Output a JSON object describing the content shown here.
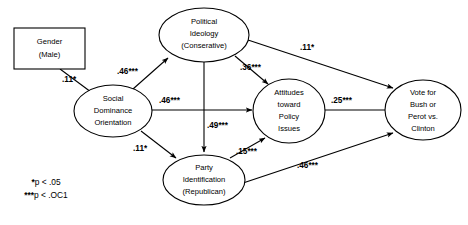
{
  "diagram": {
    "type": "path-diagram",
    "title": "",
    "nodes": [
      {
        "id": "gender",
        "shape": "rectangle",
        "lines": [
          "Gender",
          "(Male)"
        ]
      },
      {
        "id": "political-ideology",
        "shape": "ellipse",
        "lines": [
          "Political",
          "Ideology",
          "(Conserative)"
        ]
      },
      {
        "id": "social-dominance-orientation",
        "shape": "ellipse",
        "lines": [
          "Social",
          "Dominance",
          "Orientation"
        ]
      },
      {
        "id": "attitudes-toward-policy-issues",
        "shape": "ellipse",
        "lines": [
          "Attitudes",
          "toward",
          "Policy",
          "Issues"
        ]
      },
      {
        "id": "party-identification",
        "shape": "ellipse",
        "lines": [
          "Party",
          "Identification",
          "(Republican)"
        ]
      },
      {
        "id": "vote-outcome",
        "shape": "ellipse",
        "lines": [
          "Vote for",
          "Bush or",
          "Perot vs.",
          "Clinton"
        ]
      }
    ],
    "edges": [
      {
        "id": "gender-to-sdo",
        "from": "gender",
        "to": "social-dominance-orientation",
        "label": ".11*",
        "coefficient": 0.11,
        "significance": "*"
      },
      {
        "id": "sdo-to-ideology",
        "from": "social-dominance-orientation",
        "to": "political-ideology",
        "label": ".46***",
        "coefficient": 0.46,
        "significance": "***"
      },
      {
        "id": "sdo-to-attitudes",
        "from": "social-dominance-orientation",
        "to": "attitudes-toward-policy-issues",
        "label": ".46***",
        "coefficient": 0.46,
        "significance": "***"
      },
      {
        "id": "ideology-to-attitudes",
        "from": "political-ideology",
        "to": "attitudes-toward-policy-issues",
        "label": ".36***",
        "coefficient": 0.36,
        "significance": "***"
      },
      {
        "id": "ideology-to-vote",
        "from": "political-ideology",
        "to": "vote-outcome",
        "label": ".11*",
        "coefficient": 0.11,
        "significance": "*"
      },
      {
        "id": "ideology-to-party",
        "from": "political-ideology",
        "to": "party-identification",
        "label": ".49***",
        "coefficient": 0.49,
        "significance": "***"
      },
      {
        "id": "sdo-to-party",
        "from": "social-dominance-orientation",
        "to": "party-identification",
        "label": ".11*",
        "coefficient": 0.11,
        "significance": "*"
      },
      {
        "id": "attitudes-to-vote",
        "from": "attitudes-toward-policy-issues",
        "to": "vote-outcome",
        "label": ".25***",
        "coefficient": 0.25,
        "significance": "***"
      },
      {
        "id": "party-to-attitudes",
        "from": "party-identification",
        "to": "attitudes-toward-policy-issues",
        "label": ".15***",
        "coefficient": 0.15,
        "significance": "***"
      },
      {
        "id": "party-to-vote",
        "from": "party-identification",
        "to": "vote-outcome",
        "label": ".46***",
        "coefficient": 0.46,
        "significance": "***"
      }
    ],
    "legend": {
      "line1_stars": "*",
      "line1_text": "p < .05",
      "line2_stars": "***",
      "line2_text": "p < .OC1"
    }
  }
}
